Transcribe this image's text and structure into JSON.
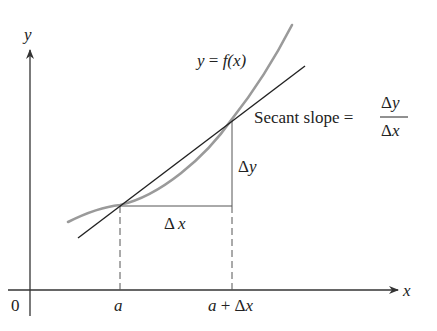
{
  "diagram": {
    "axes": {
      "x_label": "x",
      "y_label": "y",
      "origin_label": "0"
    },
    "curve_label": "y = f(x)",
    "curve_label_parts": {
      "lhs": "y",
      "eq": " = ",
      "rhs": "f(x)"
    },
    "tick_labels": {
      "a": "a",
      "a_plus_dx": "a + Δx",
      "a_plus_dx_parts": {
        "a": "a",
        "plus": " + ",
        "delta": "Δ",
        "x": "x"
      }
    },
    "delta_x_label": {
      "delta": "Δ",
      "var": "x"
    },
    "delta_y_label": {
      "delta": "Δ",
      "var": "y"
    },
    "secant_text": "Secant slope =",
    "fraction": {
      "numerator": {
        "delta": "Δ",
        "var": "y"
      },
      "denominator": {
        "delta": "Δ",
        "var": "x"
      }
    },
    "colors": {
      "axis": "#333333",
      "curve": "#9a9a9a",
      "secant": "#222222",
      "dashed": "#555555"
    }
  }
}
